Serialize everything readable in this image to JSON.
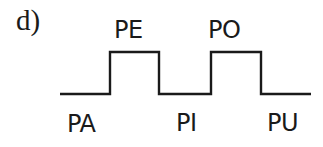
{
  "figure": {
    "label": "d)",
    "waveform": {
      "stroke_color": "#1a1a1a",
      "segments": [
        {
          "name": "PA",
          "level": "low"
        },
        {
          "name": "PE",
          "level": "high"
        },
        {
          "name": "PI",
          "level": "low"
        },
        {
          "name": "PO",
          "level": "high"
        },
        {
          "name": "PU",
          "level": "low"
        }
      ]
    },
    "labels": {
      "pa": "PA",
      "pe": "PE",
      "pi": "PI",
      "po": "PO",
      "pu": "PU"
    }
  }
}
